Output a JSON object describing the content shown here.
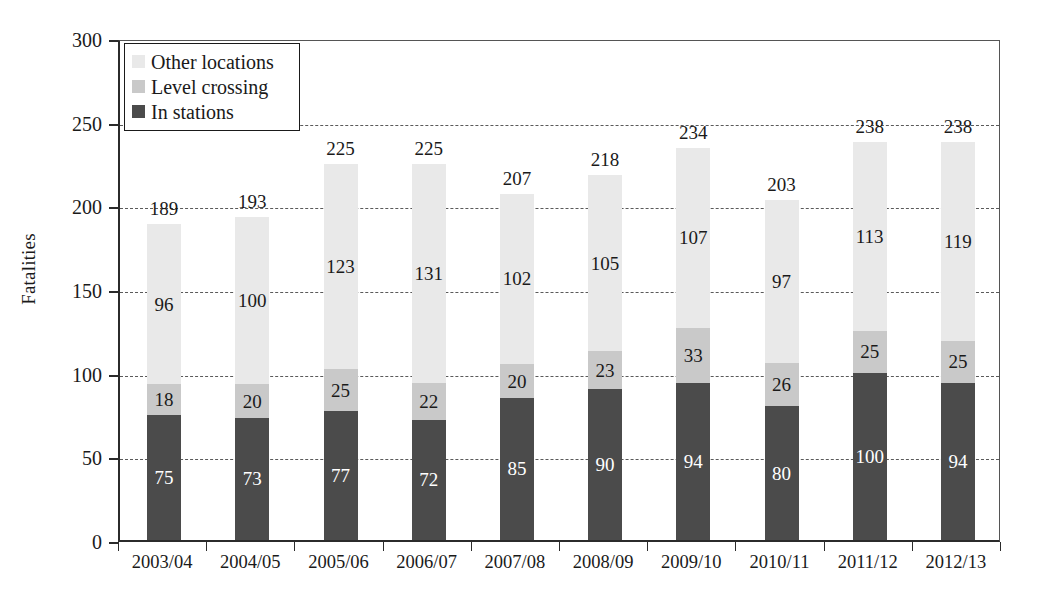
{
  "chart_data": {
    "type": "bar",
    "subtype": "stacked-bar",
    "title": "",
    "xlabel": "",
    "ylabel": "Fatalities",
    "ylim": [
      0,
      300
    ],
    "yticks": [
      0,
      50,
      100,
      150,
      200,
      250,
      300
    ],
    "grid": true,
    "grid_style": "dashed-horizontal",
    "legend_position": "top-left-inside",
    "categories": [
      "2003/04",
      "2004/05",
      "2005/06",
      "2006/07",
      "2007/08",
      "2008/09",
      "2009/10",
      "2010/11",
      "2011/12",
      "2012/13"
    ],
    "series": [
      {
        "name": "In stations",
        "color": "#4b4b4b",
        "values": [
          75,
          73,
          77,
          72,
          85,
          90,
          94,
          80,
          100,
          94
        ]
      },
      {
        "name": "Level crossing",
        "color": "#c9c9c9",
        "values": [
          18,
          20,
          25,
          22,
          20,
          23,
          33,
          26,
          25,
          25
        ]
      },
      {
        "name": "Other locations",
        "color": "#e9e9e9",
        "values": [
          96,
          100,
          123,
          131,
          102,
          105,
          107,
          97,
          113,
          119
        ]
      }
    ],
    "totals": [
      189,
      193,
      225,
      225,
      207,
      218,
      234,
      203,
      238,
      238
    ],
    "legend_order": [
      "Other locations",
      "Level crossing",
      "In stations"
    ]
  },
  "axis": {
    "y_title": "Fatalities",
    "y_tick_labels": [
      "0",
      "50",
      "100",
      "150",
      "200",
      "250",
      "300"
    ],
    "x_tick_labels": [
      "2003/04",
      "2004/05",
      "2005/06",
      "2006/07",
      "2007/08",
      "2008/09",
      "2009/10",
      "2010/11",
      "2011/12",
      "2012/13"
    ]
  },
  "legend": {
    "items": [
      {
        "label": "Other locations",
        "color": "#e9e9e9"
      },
      {
        "label": "Level crossing",
        "color": "#c9c9c9"
      },
      {
        "label": "In stations",
        "color": "#4b4b4b"
      }
    ]
  },
  "colors": {
    "in_stations": "#4b4b4b",
    "level_crossing": "#c9c9c9",
    "other_locations": "#e9e9e9",
    "axis": "#2b2b2b",
    "grid": "#5a5a5a",
    "text": "#1a1a1a"
  }
}
